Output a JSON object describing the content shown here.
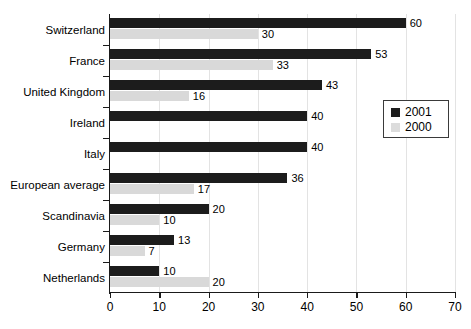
{
  "chart_data": {
    "type": "bar",
    "orientation": "horizontal",
    "title": "",
    "xlabel": "",
    "ylabel": "",
    "xlim": [
      0,
      70
    ],
    "xticks": [
      0,
      10,
      20,
      30,
      40,
      50,
      60,
      70
    ],
    "grid": true,
    "legend_position": "right-upper",
    "categories": [
      "Switzerland",
      "France",
      "United Kingdom",
      "Ireland",
      "Italy",
      "European average",
      "Scandinavia",
      "Germany",
      "Netherlands"
    ],
    "series": [
      {
        "name": "2001",
        "color": "#1c1c1c",
        "values": [
          60,
          53,
          43,
          40,
          40,
          36,
          20,
          13,
          10
        ]
      },
      {
        "name": "2000",
        "color": "#d9d9d9",
        "values": [
          30,
          33,
          16,
          null,
          null,
          17,
          10,
          7,
          20
        ]
      }
    ]
  },
  "legend": {
    "items": [
      {
        "label": "2001",
        "swatch": "sw-2001"
      },
      {
        "label": "2000",
        "swatch": "sw-2000"
      }
    ]
  }
}
